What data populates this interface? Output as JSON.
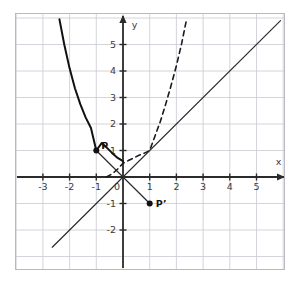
{
  "figure": {
    "title": "",
    "background": "#ffffff",
    "frame": {
      "x": 15,
      "y": 13,
      "width": 270,
      "height": 257,
      "border_color": "#b9b9c4"
    }
  },
  "chart_data": {
    "type": "line",
    "title": "",
    "xlabel": "x",
    "ylabel": "y",
    "xlim": [
      -3.9,
      5.9
    ],
    "ylim": [
      -2.7,
      5.9
    ],
    "grid": true,
    "grid_step": 1,
    "grid_color": "#c9c9d2",
    "axis_color": "#2b2b2b",
    "legend": "none",
    "xticks": [
      -3,
      -2,
      -1,
      0,
      1,
      2,
      3,
      4,
      5
    ],
    "xtick_labels": [
      "-3",
      "-2",
      "-1",
      "0",
      "1",
      "2",
      "3",
      "4",
      "5"
    ],
    "yticks": [
      -2,
      -1,
      1,
      2,
      3,
      4,
      5
    ],
    "ytick_labels": [
      "-2",
      "-1",
      "1",
      "2",
      "3",
      "4",
      "5"
    ],
    "series": [
      {
        "name": "exponential-decay-curve",
        "style": "solid",
        "color": "#111111",
        "width": 2.0,
        "equation": "y = e^(-x)",
        "points": [
          [
            -2.38,
            5.95
          ],
          [
            -2.2,
            5.0
          ],
          [
            -2.0,
            4.1
          ],
          [
            -1.8,
            3.35
          ],
          [
            -1.6,
            2.75
          ],
          [
            -1.4,
            2.25
          ],
          [
            -1.2,
            1.85
          ],
          [
            -1.0,
            1.0
          ],
          [
            -0.8,
            1.28
          ],
          [
            -0.6,
            1.1
          ],
          [
            -0.4,
            0.9
          ],
          [
            -0.2,
            0.72
          ],
          [
            0.0,
            0.6
          ]
        ]
      },
      {
        "name": "inverse-curve-dashed",
        "style": "dashed",
        "color": "#1a1a1a",
        "width": 1.6,
        "equation": "reflection of y = e^(-x) about y = x",
        "points": [
          [
            -0.62,
            0.0
          ],
          [
            -0.4,
            0.12
          ],
          [
            -0.2,
            0.3
          ],
          [
            0.0,
            0.52
          ],
          [
            0.2,
            0.62
          ],
          [
            0.4,
            0.72
          ],
          [
            0.6,
            0.82
          ],
          [
            0.8,
            0.9
          ],
          [
            1.0,
            1.0
          ],
          [
            1.2,
            1.55
          ],
          [
            1.4,
            2.1
          ],
          [
            1.6,
            2.75
          ],
          [
            1.8,
            3.45
          ],
          [
            2.0,
            4.2
          ],
          [
            2.2,
            5.05
          ],
          [
            2.38,
            5.95
          ]
        ]
      },
      {
        "name": "identity-line",
        "style": "solid",
        "color": "#2b2b2b",
        "width": 1.2,
        "equation": "y = x",
        "points": [
          [
            -2.65,
            -2.65
          ],
          [
            5.9,
            5.9
          ]
        ]
      },
      {
        "name": "reflection-connector",
        "style": "solid",
        "color": "#2b2b2b",
        "width": 1.2,
        "equation": "y = -x through P and P'",
        "points": [
          [
            -1.0,
            1.0
          ],
          [
            1.0,
            -1.0
          ]
        ]
      }
    ],
    "points": [
      {
        "name": "P",
        "label": "P",
        "x": -1,
        "y": 1,
        "label_dx": 5,
        "label_dy": -2,
        "color": "#111111",
        "radius": 3.0
      },
      {
        "name": "Pprime",
        "label": "P’",
        "x": 1,
        "y": -1,
        "label_dx": 6,
        "label_dy": 3,
        "color": "#111111",
        "radius": 3.0
      }
    ],
    "annotations": [
      {
        "name": "x-axis-label",
        "text": "x",
        "x": 5.72,
        "y": 0.47
      },
      {
        "name": "y-axis-label",
        "text": "y",
        "x": 0.33,
        "y": 5.62
      }
    ]
  }
}
